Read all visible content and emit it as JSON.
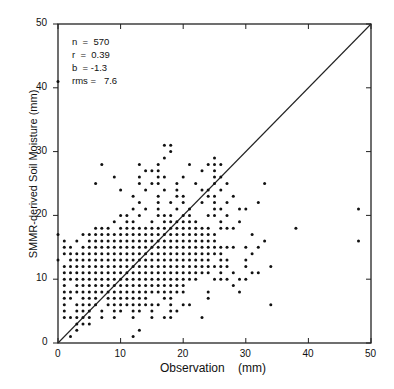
{
  "chart_data": {
    "type": "scatter",
    "title": "",
    "xlabel": "Observation   (mm)",
    "ylabel": "SMMR-derived Soil Moisture   (mm)",
    "xlim": [
      0,
      50
    ],
    "ylim": [
      0,
      50
    ],
    "xticks": [
      "0",
      "10",
      "20",
      "30",
      "40",
      "50"
    ],
    "yticks": [
      "0",
      "10",
      "20",
      "30",
      "40",
      "50"
    ],
    "grid": false,
    "legend": null,
    "reference_line": {
      "type": "1:1",
      "from": [
        0,
        0
      ],
      "to": [
        50,
        50
      ]
    },
    "annotations": {
      "n": "n  =  570",
      "r": "r  =  0.39",
      "b": "b  = -1.3",
      "rms": "rms =   7.6"
    },
    "rows": [
      {
        "y": 1,
        "x": [
          2,
          12
        ]
      },
      {
        "y": 2,
        "x": [
          3,
          13
        ]
      },
      {
        "y": 3,
        "x": [
          3,
          4,
          5
        ]
      },
      {
        "y": 4,
        "x": [
          1,
          2,
          3,
          4,
          5,
          7,
          9,
          12,
          15,
          17,
          18,
          23
        ]
      },
      {
        "y": 5,
        "x": [
          1,
          3,
          4,
          5,
          7,
          9,
          10,
          12,
          13,
          15,
          18,
          19
        ]
      },
      {
        "y": 6,
        "x": [
          1,
          3,
          4,
          5,
          6,
          8,
          9,
          10,
          11,
          12,
          13,
          14,
          15,
          16,
          18,
          20,
          21,
          34
        ]
      },
      {
        "y": 7,
        "x": [
          1,
          2,
          4,
          5,
          6,
          8,
          9,
          10,
          11,
          12,
          13,
          14,
          17,
          18,
          24
        ]
      },
      {
        "y": 8,
        "x": [
          1,
          2,
          3,
          4,
          5,
          6,
          7,
          8,
          9,
          10,
          11,
          12,
          13,
          14,
          15,
          16,
          17,
          18,
          19,
          20,
          24,
          29
        ]
      },
      {
        "y": 9,
        "x": [
          1,
          3,
          4,
          5,
          6,
          7,
          8,
          9,
          10,
          11,
          12,
          13,
          14,
          15,
          16,
          17,
          18,
          19,
          20,
          28
        ]
      },
      {
        "y": 10,
        "x": [
          1,
          2,
          3,
          4,
          5,
          6,
          7,
          8,
          9,
          10,
          11,
          12,
          13,
          14,
          15,
          16,
          17,
          18,
          19,
          20,
          21,
          22,
          25,
          26,
          27,
          29,
          30
        ]
      },
      {
        "y": 11,
        "x": [
          1,
          2,
          3,
          4,
          5,
          6,
          7,
          8,
          9,
          10,
          11,
          12,
          13,
          14,
          15,
          16,
          17,
          18,
          19,
          20,
          21,
          22,
          23,
          24,
          26,
          28,
          31,
          32
        ]
      },
      {
        "y": 12,
        "x": [
          1,
          2,
          3,
          4,
          5,
          6,
          7,
          8,
          9,
          10,
          11,
          12,
          13,
          14,
          15,
          16,
          17,
          18,
          19,
          20,
          21,
          22,
          23,
          24,
          25,
          26,
          27,
          30,
          34
        ]
      },
      {
        "y": 13,
        "x": [
          0,
          2,
          3,
          4,
          5,
          6,
          7,
          8,
          9,
          10,
          11,
          12,
          13,
          14,
          15,
          16,
          17,
          18,
          19,
          20,
          21,
          22,
          23,
          24,
          26,
          27,
          30
        ]
      },
      {
        "y": 14,
        "x": [
          1,
          2,
          3,
          4,
          5,
          6,
          7,
          8,
          9,
          10,
          11,
          12,
          13,
          14,
          15,
          16,
          17,
          18,
          19,
          20,
          21,
          22,
          23,
          24,
          25,
          26,
          31
        ]
      },
      {
        "y": 15,
        "x": [
          1,
          2,
          4,
          5,
          6,
          7,
          8,
          9,
          10,
          11,
          12,
          13,
          14,
          15,
          16,
          17,
          18,
          19,
          20,
          21,
          22,
          23,
          24,
          25,
          26,
          27,
          28,
          30,
          32
        ]
      },
      {
        "y": 16,
        "x": [
          1,
          3,
          5,
          6,
          7,
          8,
          9,
          10,
          11,
          12,
          13,
          14,
          15,
          16,
          17,
          18,
          19,
          20,
          21,
          22,
          23,
          24,
          25,
          33,
          48
        ]
      },
      {
        "y": 17,
        "x": [
          0,
          4,
          5,
          6,
          7,
          8,
          9,
          10,
          11,
          12,
          13,
          14,
          15,
          16,
          17,
          18,
          19,
          20,
          21,
          22,
          23,
          24,
          25,
          31
        ]
      },
      {
        "y": 18,
        "x": [
          6,
          7,
          8,
          10,
          11,
          12,
          13,
          14,
          15,
          16,
          17,
          18,
          19,
          20,
          21,
          22,
          23,
          24,
          26,
          27,
          28,
          38
        ]
      },
      {
        "y": 19,
        "x": [
          9,
          11,
          12,
          15,
          17,
          18,
          19,
          20,
          21,
          22,
          26,
          29
        ]
      },
      {
        "y": 20,
        "x": [
          10,
          11,
          13,
          16,
          17,
          18,
          20,
          21,
          24,
          25,
          27
        ]
      },
      {
        "y": 21,
        "x": [
          12,
          14,
          16,
          19,
          21,
          25,
          26,
          29,
          30,
          48
        ]
      },
      {
        "y": 22,
        "x": [
          13,
          16,
          18,
          20,
          23,
          25,
          27,
          32
        ]
      },
      {
        "y": 23,
        "x": [
          12,
          16,
          19,
          20,
          24,
          25,
          28
        ]
      },
      {
        "y": 24,
        "x": [
          10,
          14,
          17,
          19,
          23,
          24,
          26
        ]
      },
      {
        "y": 25,
        "x": [
          6,
          13,
          15,
          16,
          19,
          22,
          25,
          27,
          33
        ]
      },
      {
        "y": 26,
        "x": [
          9,
          13,
          16,
          17,
          20,
          25,
          26
        ]
      },
      {
        "y": 27,
        "x": [
          14,
          15,
          16,
          23,
          25
        ]
      },
      {
        "y": 28,
        "x": [
          7,
          13,
          16,
          21,
          24,
          25,
          26
        ]
      },
      {
        "y": 29,
        "x": [
          17,
          25
        ]
      },
      {
        "y": 30,
        "x": [
          18
        ]
      },
      {
        "y": 31,
        "x": [
          17,
          18
        ]
      },
      {
        "y": 41,
        "x": [
          0
        ]
      }
    ]
  }
}
